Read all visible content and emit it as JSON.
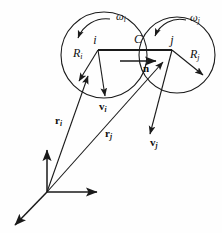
{
  "figure": {
    "type": "physics-diagram",
    "background_color": "#fefefe",
    "line_color": "#1a1a1a",
    "text_color": "#101010"
  },
  "particles": [
    {
      "id": "i",
      "center_label": "i",
      "radius_label": "R",
      "radius_subscript": "i",
      "angular_velocity_label": "ω",
      "angular_velocity_subscript": "i",
      "velocity_label": "v",
      "velocity_subscript": "i",
      "position_label": "r",
      "position_subscript": "i",
      "center_px": [
        104,
        55
      ],
      "radius_px": 43
    },
    {
      "id": "j",
      "center_label": "j",
      "radius_label": "R",
      "radius_subscript": "j",
      "angular_velocity_label": "ω",
      "angular_velocity_subscript": "j",
      "velocity_label": "v",
      "velocity_subscript": "j",
      "position_label": "r",
      "position_subscript": "j",
      "center_px": [
        177,
        55
      ],
      "radius_px": 38
    }
  ],
  "contact": {
    "label": "C",
    "normal_label": "n",
    "point_px": [
      140,
      50
    ]
  },
  "axes": {
    "origin_px": [
      47,
      192
    ],
    "arms": [
      "vertical-up",
      "horizontal-right",
      "diagonal-down-left"
    ]
  },
  "labels": {
    "omega_i": "ω",
    "omega_i_sub": "i",
    "omega_j": "ω",
    "omega_j_sub": "j",
    "R_i": "R",
    "R_i_sub": "i",
    "R_j": "R",
    "R_j_sub": "j",
    "i": "i",
    "j": "j",
    "C": "C",
    "n": "n",
    "v_i": "v",
    "v_i_sub": "i",
    "v_j": "v",
    "v_j_sub": "j",
    "r_i": "r",
    "r_i_sub": "i",
    "r_j": "r",
    "r_j_sub": "j"
  }
}
